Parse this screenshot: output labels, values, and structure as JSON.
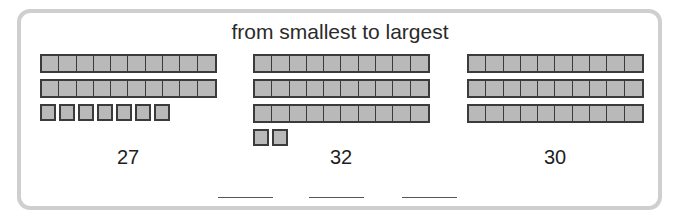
{
  "worksheet": {
    "instruction": "from smallest to largest",
    "groups": [
      {
        "tens": 2,
        "ones": 7,
        "label": "27"
      },
      {
        "tens": 3,
        "ones": 2,
        "label": "32"
      },
      {
        "tens": 3,
        "ones": 0,
        "label": "30"
      }
    ],
    "answer_blanks": [
      "",
      "",
      ""
    ],
    "colors": {
      "block_fill": "#b9b9b9",
      "block_border": "#3b3b3b",
      "frame": "#cfcfcf"
    }
  }
}
